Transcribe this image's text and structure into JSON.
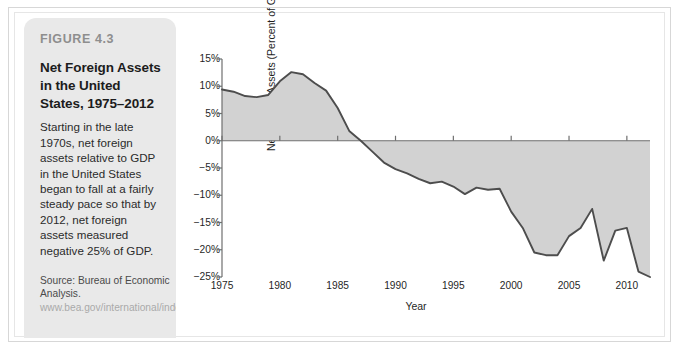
{
  "figure": {
    "number": "FIGURE 4.3",
    "title": "Net Foreign Assets in the United States, 1975–2012",
    "description": "Starting in the late 1970s, net foreign assets relative to GDP in the United States began to fall at a fairly steady pace so that by 2012, net foreign assets measured negative 25% of GDP.",
    "source_prefix": "Source: Bureau of Economic Analysis.",
    "source_url": "www.bea.gov/international/index.htm/iip"
  },
  "colors": {
    "panel_background": "#e9e9e9",
    "figure_number": "#8e8e8e",
    "line": "#4d4d4d",
    "area_fill": "#d2d2d2",
    "axis": "#6f6f6f",
    "text": "#1f1f1f",
    "frame": "#d7d7d7"
  },
  "chart_data": {
    "type": "area",
    "title": "Net Foreign Assets in the United States, 1975–2012",
    "xlabel": "Year",
    "ylabel": "Net Foreign Assets (Percent of GDP)",
    "xlim": [
      1975,
      2012
    ],
    "ylim": [
      -25,
      15
    ],
    "grid": false,
    "legend": false,
    "y_tick_labels": [
      "15%",
      "10%",
      "5%",
      "0%",
      "−5%",
      "−10%",
      "−15%",
      "−20%",
      "−25%"
    ],
    "y_ticks": [
      15,
      10,
      5,
      0,
      -5,
      -10,
      -15,
      -20,
      -25
    ],
    "x_tick_labels": [
      "1975",
      "1980",
      "1985",
      "1990",
      "1995",
      "2000",
      "2005",
      "2010"
    ],
    "x_ticks": [
      1975,
      1980,
      1985,
      1990,
      1995,
      2000,
      2005,
      2010
    ],
    "baseline": 0,
    "series": [
      {
        "name": "Net Foreign Assets (Percent of GDP)",
        "x": [
          1975,
          1976,
          1977,
          1978,
          1979,
          1980,
          1981,
          1982,
          1983,
          1984,
          1985,
          1986,
          1987,
          1988,
          1989,
          1990,
          1991,
          1992,
          1993,
          1994,
          1995,
          1996,
          1997,
          1998,
          1999,
          2000,
          2001,
          2002,
          2003,
          2004,
          2005,
          2006,
          2007,
          2008,
          2009,
          2010,
          2011,
          2012
        ],
        "values": [
          9.4,
          9.0,
          8.2,
          8.0,
          8.4,
          10.9,
          12.6,
          12.2,
          10.6,
          9.2,
          6.0,
          1.8,
          0.0,
          -2.0,
          -4.0,
          -5.2,
          -6.0,
          -7.0,
          -7.8,
          -7.5,
          -8.4,
          -9.8,
          -8.6,
          -9.0,
          -8.8,
          -13.0,
          -16.0,
          -20.5,
          -21.0,
          -21.0,
          -17.5,
          -16.0,
          -12.5,
          -22.0,
          -16.5,
          -16.0,
          -24.0,
          -25.0
        ]
      }
    ]
  }
}
